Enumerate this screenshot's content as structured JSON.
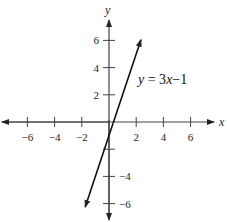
{
  "chart_data": {
    "type": "line",
    "title": "",
    "xlabel": "x",
    "ylabel": "y",
    "xlim": [
      -7.5,
      7.5
    ],
    "ylim": [
      -7.5,
      7.5
    ],
    "grid": false,
    "x_ticks": [
      -6,
      -4,
      -2,
      2,
      4,
      6
    ],
    "x_tick_labels": [
      "−6",
      "−4",
      "−2",
      "2",
      "4",
      "6"
    ],
    "y_ticks": [
      6,
      4,
      2,
      -2,
      -4,
      -6
    ],
    "y_tick_labels": [
      "6",
      "4",
      "2",
      "",
      "−4",
      "−6"
    ],
    "series": [
      {
        "name": "y = 3x − 1",
        "equation": "y = 3x - 1",
        "slope": 3,
        "intercept": -1,
        "x": [
          -1.75,
          2.35
        ],
        "y": [
          -6.25,
          6.05
        ],
        "arrows": "both"
      }
    ],
    "annotations": [
      {
        "text": "y = 3x − 1",
        "x": 2.8,
        "y": 3.0
      }
    ]
  },
  "labels": {
    "x_axis": "x",
    "y_axis": "y",
    "equation_y": "y",
    "equation_mid": " = 3",
    "equation_x": "x",
    "equation_end": "−1"
  }
}
